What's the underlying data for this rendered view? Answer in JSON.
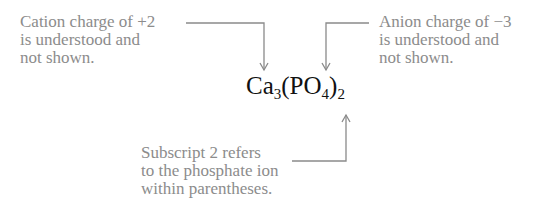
{
  "diagram": {
    "formula": {
      "parts": [
        {
          "text": "Ca",
          "sub": "3"
        },
        {
          "text": "(PO",
          "sub": "4"
        },
        {
          "text": ")",
          "sub": "2"
        }
      ]
    },
    "annotations": {
      "cation": {
        "lines": [
          "Cation charge of +2",
          "is understood and",
          "not shown."
        ],
        "target": "Ca"
      },
      "anion": {
        "lines": [
          "Anion charge of −3",
          "is understood and",
          "not shown."
        ],
        "target": "PO4"
      },
      "subscript": {
        "lines": [
          "Subscript 2 refers",
          "to the phosphate ion",
          "within parentheses."
        ],
        "target": "subscript 2"
      }
    },
    "colors": {
      "annotation_text": "#8c8c8c",
      "connector": "#8a8a8a",
      "formula_text": "#111111"
    }
  }
}
